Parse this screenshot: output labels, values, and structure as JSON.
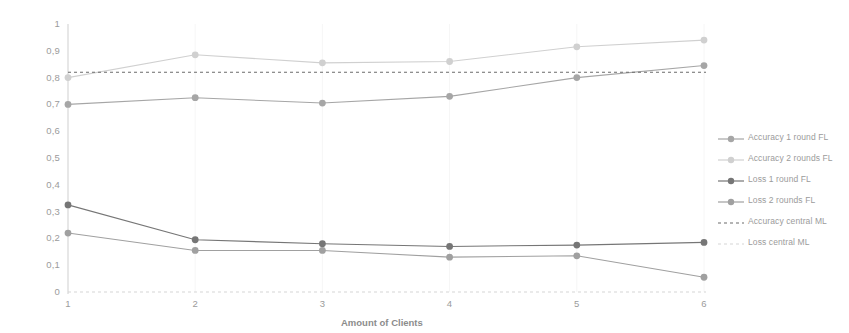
{
  "chart_data": {
    "type": "line",
    "title": "",
    "xlabel": "Amount of Clients",
    "ylabel": "",
    "x": [
      1,
      2,
      3,
      4,
      5,
      6
    ],
    "xtick_labels": [
      "1",
      "2",
      "3",
      "4",
      "5",
      "6"
    ],
    "ytick_labels": [
      "0",
      "0,1",
      "0,2",
      "0,3",
      "0,4",
      "0,5",
      "0,6",
      "0,7",
      "0,8",
      "0,9",
      "1"
    ],
    "ytick_values": [
      0,
      0.1,
      0.2,
      0.3,
      0.4,
      0.5,
      0.6,
      0.7,
      0.8,
      0.9,
      1
    ],
    "ylim": [
      0,
      1
    ],
    "xlim": [
      1,
      6
    ],
    "grid": false,
    "legend_position": "right",
    "series": [
      {
        "name": "Accuracy 1 round FL",
        "style": "solid-marker",
        "color": "#a6a6a6",
        "values": [
          0.7,
          0.725,
          0.705,
          0.73,
          0.8,
          0.845
        ]
      },
      {
        "name": "Accuracy 2 rounds FL",
        "style": "solid-marker",
        "color": "#d0d0d0",
        "values": [
          0.8,
          0.885,
          0.855,
          0.86,
          0.915,
          0.94
        ]
      },
      {
        "name": "Loss 1 round FL",
        "style": "solid-marker",
        "color": "#767676",
        "values": [
          0.325,
          0.195,
          0.18,
          0.17,
          0.175,
          0.185
        ]
      },
      {
        "name": "Loss 2 rounds FL",
        "style": "solid-marker",
        "color": "#a0a0a0",
        "values": [
          0.22,
          0.155,
          0.155,
          0.13,
          0.135,
          0.055
        ]
      },
      {
        "name": "Accuracy central ML",
        "style": "dashed",
        "color": "#6b6b6b",
        "constant": 0.82
      },
      {
        "name": "Loss central ML",
        "style": "dashed",
        "color": "#d6d6d6",
        "constant": 0.0
      }
    ]
  },
  "legend": {
    "items": [
      {
        "label": "Accuracy 1 round FL"
      },
      {
        "label": "Accuracy 2 rounds FL"
      },
      {
        "label": "Loss 1 round FL"
      },
      {
        "label": "Loss 2 rounds FL"
      },
      {
        "label": "Accuracy central ML"
      },
      {
        "label": "Loss central ML"
      }
    ]
  }
}
